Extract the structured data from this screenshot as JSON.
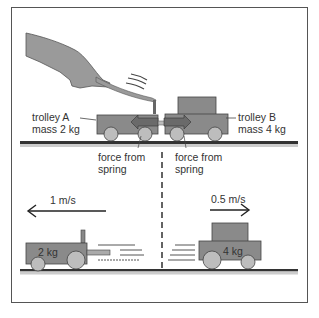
{
  "diagram": {
    "top_scene": {
      "trolley_a": {
        "name": "trolley A",
        "mass": "mass 2 kg"
      },
      "trolley_b": {
        "name": "trolley B",
        "mass": "mass 4 kg"
      },
      "force_labels": [
        {
          "line1": "force from",
          "line2": "spring"
        },
        {
          "line1": "force from",
          "line2": "spring"
        }
      ]
    },
    "bottom_scene": {
      "left": {
        "mass_label": "2 kg",
        "velocity": "1 m/s",
        "direction": "left"
      },
      "right": {
        "mass_label": "4 kg",
        "velocity": "0.5 m/s",
        "direction": "right"
      }
    },
    "colors": {
      "trolley_fill": "#8a8a8a",
      "wheel_fill": "#bdbdbd",
      "hand_fill": "#9a9a9a",
      "ground": "#333333",
      "text": "#333333"
    }
  }
}
